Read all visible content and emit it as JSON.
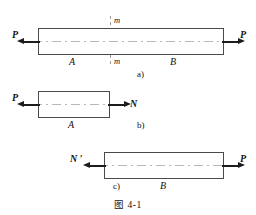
{
  "figure": {
    "caption": "图  4-1",
    "subfigures": [
      {
        "key": "a",
        "part_label": "a)",
        "forces": [
          {
            "name": "P-left",
            "label": "P",
            "direction": "left"
          },
          {
            "name": "P-right",
            "label": "P",
            "direction": "right"
          }
        ],
        "regions": [
          {
            "name": "A",
            "label": "A"
          },
          {
            "name": "B",
            "label": "B"
          }
        ],
        "section_marks": [
          {
            "name": "m-top",
            "label": "m"
          },
          {
            "name": "m-bottom",
            "label": "m"
          }
        ]
      },
      {
        "key": "b",
        "part_label": "b)",
        "forces": [
          {
            "name": "P-left",
            "label": "P",
            "direction": "left"
          },
          {
            "name": "N-right",
            "label": "N",
            "direction": "right"
          }
        ],
        "regions": [
          {
            "name": "A",
            "label": "A"
          }
        ],
        "section_marks": []
      },
      {
        "key": "c",
        "part_label": "c)",
        "forces": [
          {
            "name": "N-prime-left",
            "label": "N ′",
            "direction": "left"
          },
          {
            "name": "P-right",
            "label": "P",
            "direction": "right"
          }
        ],
        "regions": [
          {
            "name": "B",
            "label": "B"
          }
        ],
        "section_marks": []
      }
    ]
  },
  "colors": {
    "bar_outline": "#4a4a4a",
    "arrow": "#1c1c1c",
    "axis": "#b8b8b8",
    "background": "#ffffff",
    "text": "#111111"
  }
}
